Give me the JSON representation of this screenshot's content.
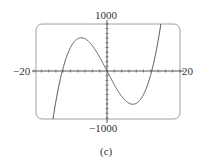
{
  "chart_data": {
    "type": "line",
    "title": "",
    "caption": "(c)",
    "xlabel": "",
    "ylabel": "",
    "xlim": [
      -20,
      20
    ],
    "ylim": [
      -1000,
      1000
    ],
    "x_tick_labels": {
      "left": "−20",
      "right": "20"
    },
    "y_tick_labels": {
      "top": "1000",
      "bottom": "−1000"
    },
    "x_tick_interval": 2,
    "y_tick_interval": 100,
    "grid": false,
    "function": "y = x^3 - 150x (approx.)",
    "series": [
      {
        "name": "f(x)",
        "x": [
          -16.7,
          -15,
          -12.25,
          -10,
          -7.07,
          -5,
          -2.5,
          0,
          2.5,
          5,
          7.07,
          10,
          12.25,
          15,
          16.7
        ],
        "y": [
          -1000,
          -1125,
          0,
          500,
          707,
          625,
          359,
          0,
          -359,
          -625,
          -707,
          -500,
          0,
          1125,
          1000
        ]
      }
    ],
    "features": {
      "roots": [
        -12.25,
        0,
        12.25
      ],
      "local_max": [
        -7.07,
        707
      ],
      "local_min": [
        7.07,
        -707
      ]
    }
  },
  "labels": {
    "y_top": "1000",
    "y_bottom": "−1000",
    "x_left": "−20",
    "x_right": "20",
    "caption": "(c)"
  }
}
